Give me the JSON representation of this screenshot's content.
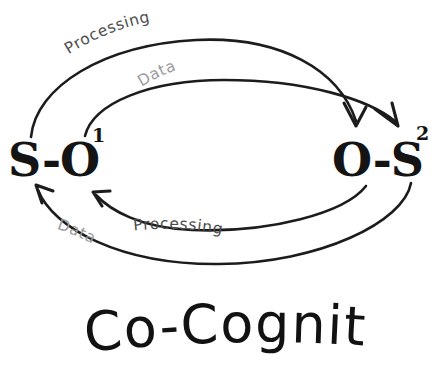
{
  "diagram": {
    "title": "Co-Cognition",
    "background_color": "#ffffff",
    "ink_color": "#1c1c1c",
    "nodes": [
      {
        "id": "node-left",
        "base": "S-O",
        "superscript": "1",
        "full_label": "S-O¹",
        "position": "left"
      },
      {
        "id": "node-right",
        "base": "O-S",
        "superscript": "2",
        "full_label": "O-S²",
        "position": "right"
      }
    ],
    "edges": [
      {
        "id": "edge-top-outer",
        "label": "Processing",
        "from": "node-left",
        "to": "node-right",
        "direction": "left-to-right",
        "label_color": "#4d4d4d",
        "track": "outer-top"
      },
      {
        "id": "edge-top-inner",
        "label": "Data",
        "from": "node-left",
        "to": "node-right",
        "direction": "left-to-right",
        "label_color": "#9a9a9a",
        "track": "inner-top"
      },
      {
        "id": "edge-bottom-inner",
        "label": "Processing",
        "from": "node-right",
        "to": "node-left",
        "direction": "right-to-left",
        "label_color": "#4d4d4d",
        "track": "inner-bottom"
      },
      {
        "id": "edge-bottom-outer",
        "label": "Data",
        "from": "node-right",
        "to": "node-left",
        "direction": "right-to-left",
        "label_color": "#9a9a9a",
        "track": "outer-bottom"
      }
    ]
  }
}
